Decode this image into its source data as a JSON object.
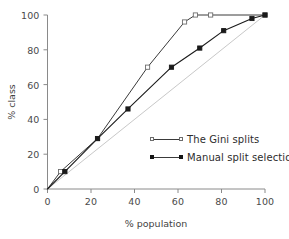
{
  "chart_data": {
    "type": "line",
    "title": "",
    "xlabel": "% population",
    "ylabel": "% class",
    "xlim": [
      0,
      100
    ],
    "ylim": [
      0,
      100
    ],
    "xticks": [
      0,
      20,
      40,
      60,
      80,
      100
    ],
    "yticks": [
      0,
      20,
      40,
      60,
      80,
      100
    ],
    "grid": false,
    "legend_position": "center-right-inside",
    "series": [
      {
        "name": "The Gini splits",
        "marker": "open-square",
        "color": "#3a3a3a",
        "x": [
          0,
          6,
          23,
          46,
          63,
          68,
          75,
          100
        ],
        "y": [
          0,
          10,
          29,
          70,
          96,
          100,
          100,
          100
        ]
      },
      {
        "name": "Manual split selection",
        "marker": "filled-square",
        "color": "#1a1a1a",
        "x": [
          0,
          8,
          23,
          37,
          57,
          70,
          81,
          94,
          100
        ],
        "y": [
          0,
          10,
          29,
          46,
          70,
          81,
          91,
          98,
          100
        ]
      },
      {
        "name": "reference-diagonal",
        "marker": "none",
        "color": "#c8c8c8",
        "x": [
          0,
          100
        ],
        "y": [
          0,
          100
        ]
      }
    ]
  },
  "legend": {
    "items": [
      {
        "label": "The Gini splits",
        "marker": "open-square"
      },
      {
        "label": "Manual split selection",
        "marker": "filled-square"
      }
    ]
  },
  "axes": {
    "x_title": "% population",
    "y_title": "% class",
    "x_tick_labels": [
      "0",
      "20",
      "40",
      "60",
      "80",
      "100"
    ],
    "y_tick_labels": [
      "0",
      "20",
      "40",
      "60",
      "80",
      "100"
    ]
  },
  "colors": {
    "background": "#ffffff",
    "axis": "#8a8a8a",
    "gini_line": "#3a3a3a",
    "manual_line": "#1a1a1a",
    "diagonal": "#c8c8c8",
    "text": "#3f3f3f"
  }
}
